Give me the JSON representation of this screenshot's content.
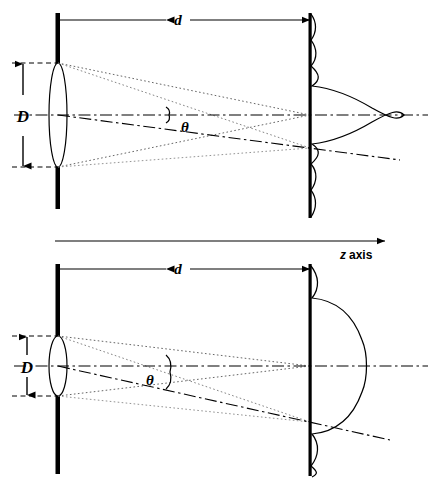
{
  "figure": {
    "type": "optics-diffraction-diagram",
    "stroke_color": "#000000",
    "background_color": "#ffffff"
  },
  "axis": {
    "label_symbol": "z",
    "label_word": "axis",
    "arrow_direction": "right"
  },
  "panels": [
    {
      "id": "top-panel",
      "aperture_label": "D",
      "distance_label": "d",
      "angle_label": "θ",
      "aperture_diameter_px": 104,
      "distance_px": 252,
      "optical_axis_y": 115,
      "offaxis_focus_y": 148,
      "note": "larger aperture, smaller θ, narrow diffraction pattern"
    },
    {
      "id": "bottom-panel",
      "aperture_label": "D",
      "distance_label": "d",
      "angle_label": "θ",
      "aperture_diameter_px": 60,
      "distance_px": 252,
      "optical_axis_y": 366,
      "offaxis_focus_y": 422,
      "note": "smaller aperture, larger θ, broad diffraction pattern"
    }
  ],
  "elements": {
    "aperture_plane_name": "aperture-bar",
    "lens_name": "lens-ellipse",
    "screen_name": "observation-screen",
    "pattern_name": "airy-diffraction-profile"
  }
}
